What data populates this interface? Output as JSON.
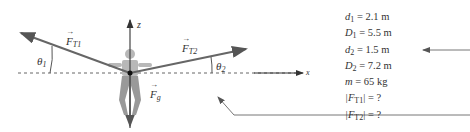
{
  "figure": {
    "axis_z": "z",
    "axis_x": "x",
    "force_T1": "F",
    "force_T1_sub": "T1",
    "force_T2": "F",
    "force_T2_sub": "T2",
    "force_g": "F",
    "force_g_sub": "g",
    "theta1": "θ",
    "theta1_sub": "1",
    "theta2": "θ",
    "theta2_sub": "2"
  },
  "given": [
    {
      "sym": "d",
      "sub": "1",
      "rest": " = 2.1 m"
    },
    {
      "sym": "D",
      "sub": "1",
      "rest": " = 5.5 m"
    },
    {
      "sym": "d",
      "sub": "2",
      "rest": " = 1.5 m"
    },
    {
      "sym": "D",
      "sub": "2",
      "rest": " = 7.2 m"
    },
    {
      "sym": "m",
      "sub": "",
      "rest": " = 65 kg"
    },
    {
      "sym": "|F",
      "sub": "T1",
      "rest": "| = ?"
    },
    {
      "sym": "|F",
      "sub": "T2",
      "rest": "| = ?"
    }
  ]
}
